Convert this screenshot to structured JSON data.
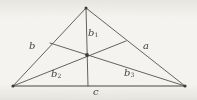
{
  "figure": {
    "kind": "geometry-diagram",
    "background_color": "#f4f3ef",
    "stroke_color": "#4a4843",
    "label_color": "#46443f"
  },
  "labels": {
    "side_left": {
      "base": "b",
      "sub": ""
    },
    "side_right": {
      "base": "a",
      "sub": ""
    },
    "side_bottom": {
      "base": "c",
      "sub": ""
    },
    "cevian_top": {
      "base": "b",
      "sub": "1"
    },
    "cevian_lower_left": {
      "base": "b",
      "sub": "2"
    },
    "cevian_lower_right": {
      "base": "b",
      "sub": "3"
    }
  },
  "geometry": {
    "apex": {
      "x": 86,
      "y": 8
    },
    "bottom_left": {
      "x": 13,
      "y": 86
    },
    "bottom_right": {
      "x": 185,
      "y": 86
    },
    "incenter": {
      "x": 87,
      "y": 55
    },
    "foot_left_side": {
      "x": 50,
      "y": 43
    },
    "foot_right_side": {
      "x": 126,
      "y": 41
    },
    "foot_base": {
      "x": 88,
      "y": 86
    }
  }
}
